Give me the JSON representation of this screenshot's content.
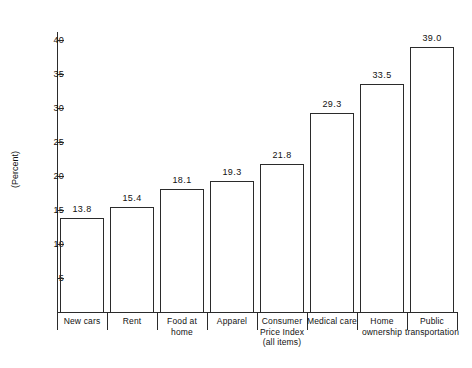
{
  "chart_data": {
    "type": "bar",
    "title": "",
    "subtitle": "",
    "xlabel": "",
    "ylabel": "(Percent)",
    "ylim": [
      0,
      42
    ],
    "grid": false,
    "legend": null,
    "categories": [
      "New cars",
      "Rent",
      "Food at home",
      "Apparel",
      "Consumer Price Index (all items)",
      "Medical care",
      "Home ownership",
      "Public transportation"
    ],
    "category_lines": [
      [
        "New cars"
      ],
      [
        "Rent"
      ],
      [
        "Food at",
        "home"
      ],
      [
        "Apparel"
      ],
      [
        "Consumer",
        "Price Index",
        "(all items)"
      ],
      [
        "Medical care"
      ],
      [
        "Home",
        "ownership"
      ],
      [
        "Public",
        "transportation"
      ]
    ],
    "values": [
      13.8,
      15.4,
      18.1,
      19.3,
      21.8,
      29.3,
      33.5,
      39.0
    ],
    "value_labels": [
      "13.8",
      "15.4",
      "18.1",
      "19.3",
      "21.8",
      "29.3",
      "33.5",
      "39.0"
    ],
    "y_ticks": [
      5,
      10,
      15,
      20,
      25,
      30,
      35,
      40
    ],
    "y_tick_labels": [
      "5",
      "10",
      "15",
      "20",
      "25",
      "30",
      "35",
      "40"
    ],
    "bar_style": "outline",
    "colors": {
      "axis": "#2b2b2b",
      "bar_outline": "#2b2b2b",
      "bar_fill": "#ffffff",
      "text": "#111111",
      "background": "#ffffff"
    }
  },
  "footer": {
    "cut_text": ""
  }
}
